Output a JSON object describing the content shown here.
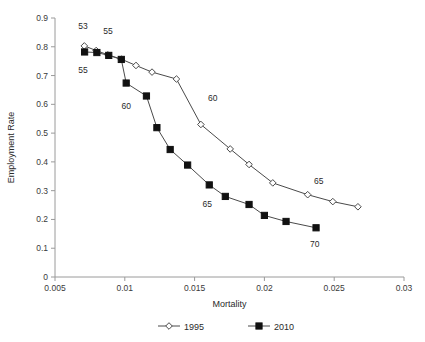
{
  "chart_data": {
    "type": "line",
    "title": "",
    "subtitle": "",
    "xlabel": "Mortality",
    "ylabel": "Employment Rate",
    "xlim": [
      0.005,
      0.03
    ],
    "ylim": [
      0,
      0.9
    ],
    "xticks": [
      "0.005",
      "0.01",
      "0.015",
      "0.02",
      "0.025",
      "0.03"
    ],
    "xtick_values": [
      0.005,
      0.01,
      0.015,
      0.02,
      0.025,
      0.03
    ],
    "yticks": [
      "0",
      "0.1",
      "0.2",
      "0.3",
      "0.4",
      "0.5",
      "0.6",
      "0.7",
      "0.8",
      "0.9"
    ],
    "ytick_values": [
      0,
      0.1,
      0.2,
      0.3,
      0.4,
      0.5,
      0.6,
      0.7,
      0.8,
      0.9
    ],
    "grid": false,
    "legend_position": "bottom",
    "series": [
      {
        "name": "1995",
        "marker": "open-diamond",
        "color": "#4a4a4a",
        "x": [
          0.0071,
          0.00795,
          0.0088,
          0.00975,
          0.0108,
          0.01195,
          0.0137,
          0.01545,
          0.01755,
          0.0189,
          0.0206,
          0.0231,
          0.0249,
          0.0267
        ],
        "y": [
          0.803,
          0.787,
          0.772,
          0.757,
          0.735,
          0.712,
          0.688,
          0.53,
          0.445,
          0.391,
          0.327,
          0.286,
          0.262,
          0.244
        ]
      },
      {
        "name": "2010",
        "marker": "filled-square",
        "color": "#111111",
        "x": [
          0.00712,
          0.008,
          0.00885,
          0.00975,
          0.0101,
          0.01155,
          0.0123,
          0.01325,
          0.0145,
          0.01605,
          0.0172,
          0.0189,
          0.02,
          0.02155,
          0.0237
        ],
        "y": [
          0.782,
          0.78,
          0.77,
          0.756,
          0.674,
          0.629,
          0.519,
          0.443,
          0.389,
          0.32,
          0.28,
          0.252,
          0.214,
          0.193,
          0.171
        ]
      }
    ],
    "annotations": [
      {
        "text": "53",
        "x": 0.007,
        "y": 0.862,
        "series": "1995"
      },
      {
        "text": "55",
        "x": 0.0088,
        "y": 0.845,
        "series": "1995"
      },
      {
        "text": "55",
        "x": 0.007,
        "y": 0.708,
        "series": "2010"
      },
      {
        "text": "60",
        "x": 0.0101,
        "y": 0.585,
        "series": "2010"
      },
      {
        "text": "60",
        "x": 0.0163,
        "y": 0.613,
        "series": "1995"
      },
      {
        "text": "65",
        "x": 0.0159,
        "y": 0.242,
        "series": "2010"
      },
      {
        "text": "65",
        "x": 0.0239,
        "y": 0.322,
        "series": "1995"
      },
      {
        "text": "70",
        "x": 0.0236,
        "y": 0.103,
        "series": "2010"
      }
    ]
  },
  "legend": {
    "entries": [
      {
        "label": "1995",
        "marker": "open-diamond"
      },
      {
        "label": "2010",
        "marker": "filled-square"
      }
    ]
  }
}
